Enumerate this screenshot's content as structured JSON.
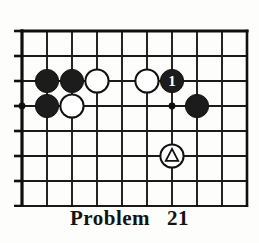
{
  "caption": {
    "label": "Problem",
    "number": "21"
  },
  "board": {
    "name": "go-board-diagram",
    "cols": 10,
    "rows": 8,
    "cell": 25,
    "origin_x": 8,
    "origin_y": 8,
    "line_color": "#1a1a1a",
    "edge_color": "#101010",
    "black_color": "#1c1c1c",
    "white_color": "#ffffff",
    "background": "#fdfdfb",
    "edges": {
      "top": true,
      "left": true,
      "right": false,
      "bottom": false
    },
    "star_points": [
      {
        "name": "star-point-left",
        "col": 0,
        "row": 3
      },
      {
        "name": "star-point-center",
        "col": 6,
        "row": 3
      }
    ],
    "stones": [
      {
        "name": "black-stone-a",
        "col": 1,
        "row": 2,
        "color": "black",
        "label": "",
        "mark": ""
      },
      {
        "name": "black-stone-b",
        "col": 2,
        "row": 2,
        "color": "black",
        "label": "",
        "mark": ""
      },
      {
        "name": "white-stone-a",
        "col": 3,
        "row": 2,
        "color": "white",
        "label": "",
        "mark": ""
      },
      {
        "name": "white-stone-b",
        "col": 5,
        "row": 2,
        "color": "white",
        "label": "",
        "mark": ""
      },
      {
        "name": "black-move-1",
        "col": 6,
        "row": 2,
        "color": "black",
        "label": "1",
        "mark": ""
      },
      {
        "name": "black-stone-c",
        "col": 1,
        "row": 3,
        "color": "black",
        "label": "",
        "mark": ""
      },
      {
        "name": "white-stone-c",
        "col": 2,
        "row": 3,
        "color": "white",
        "label": "",
        "mark": ""
      },
      {
        "name": "black-stone-d",
        "col": 7,
        "row": 3,
        "color": "black",
        "label": "",
        "mark": ""
      },
      {
        "name": "white-triangle-stone",
        "col": 6,
        "row": 5,
        "color": "white",
        "label": "",
        "mark": "triangle"
      }
    ]
  }
}
